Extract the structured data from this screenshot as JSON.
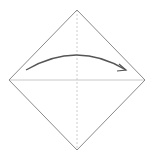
{
  "diagram": {
    "type": "origami-fold-step",
    "colors": {
      "background": "#ffffff",
      "outline": "#8a8a8a",
      "crease": "#c8c8c8",
      "dashed_line": "#c0c0c0",
      "arrow": "#555555"
    },
    "shape": {
      "top": [
        77,
        10
      ],
      "right": [
        145,
        80
      ],
      "bottom": [
        77,
        150
      ],
      "left": [
        9,
        80
      ]
    },
    "arrow": {
      "direction": "left-to-right",
      "start": [
        26,
        70
      ],
      "control": [
        77,
        40
      ],
      "end": [
        126,
        70
      ]
    }
  }
}
